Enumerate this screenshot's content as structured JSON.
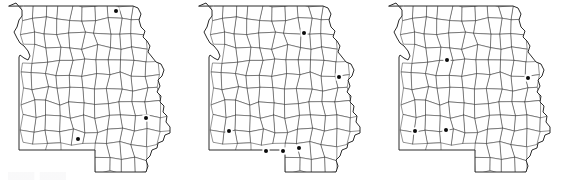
{
  "figure": {
    "panel_count": 3,
    "state": "Missouri",
    "marker_label": "occurrence-dot",
    "background_color": "#ffffff",
    "county_line_color": "#3a3a3a",
    "state_line_color": "#2a2a2a",
    "marker_color": "#0b0b0b"
  },
  "panels": [
    {
      "id": "panel-1",
      "label": "Map A",
      "origin_x": 0,
      "marker_count": 3,
      "markers": [
        {
          "name": "marker-northeast",
          "x": 116,
          "y": 11
        },
        {
          "name": "marker-east",
          "x": 146,
          "y": 118
        },
        {
          "name": "marker-southwest",
          "x": 78,
          "y": 139
        }
      ]
    },
    {
      "id": "panel-2",
      "label": "Map B",
      "origin_x": 190,
      "marker_count": 6,
      "markers": [
        {
          "name": "marker-north",
          "x": 114,
          "y": 33
        },
        {
          "name": "marker-east",
          "x": 149,
          "y": 77
        },
        {
          "name": "marker-west",
          "x": 39,
          "y": 131
        },
        {
          "name": "marker-south-1",
          "x": 76,
          "y": 151
        },
        {
          "name": "marker-south-2",
          "x": 93,
          "y": 151
        },
        {
          "name": "marker-south-3",
          "x": 109,
          "y": 148
        }
      ]
    },
    {
      "id": "panel-3",
      "label": "Map C",
      "origin_x": 380,
      "marker_count": 4,
      "markers": [
        {
          "name": "marker-north-central",
          "x": 67,
          "y": 60
        },
        {
          "name": "marker-east",
          "x": 148,
          "y": 78
        },
        {
          "name": "marker-southwest",
          "x": 35,
          "y": 131
        },
        {
          "name": "marker-south-central",
          "x": 66,
          "y": 130
        }
      ]
    }
  ]
}
